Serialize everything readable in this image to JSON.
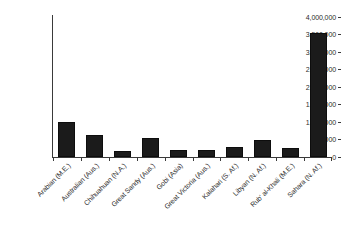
{
  "chart_data": {
    "type": "bar",
    "title": "",
    "xlabel": "",
    "ylabel": "",
    "ylim": [
      0,
      4000000
    ],
    "grid": false,
    "legend": "none",
    "bar_color": "#1b1b1b",
    "axis_color": "#3a3a3a",
    "background": "#ffffff",
    "label_rotation_deg": -45,
    "categories": [
      "Arabian (M.E.)",
      "Australian (Aus.)",
      "Chihuahuan (N.A.)",
      "Great Sandy (Aus.)",
      "Gobi (Asia)",
      "Great Victoria (Aus.)",
      "Kalahari (S. Af.)",
      "Libyan (N. Af.)",
      "Rub' al-Khali (M.E.)",
      "Sahara (N. Af.)"
    ],
    "values": [
      1000000,
      630000,
      175000,
      540000,
      200000,
      200000,
      285000,
      490000,
      260000,
      3540000
    ],
    "ytick_values": [
      4000000,
      3500000,
      3000000,
      2500000,
      2000000,
      1500000,
      1000000,
      500000,
      0
    ],
    "ytick_labels": [
      "4,000,000",
      "3,500,000",
      "3,000,000",
      "2,500,000",
      "2,000,000",
      "1,500,000",
      "1,000,000",
      "500,000",
      "0"
    ]
  }
}
